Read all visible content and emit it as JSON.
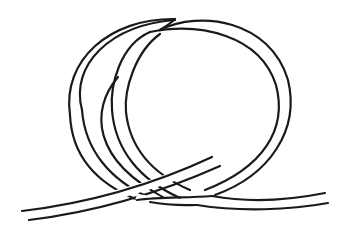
{
  "figure": {
    "colors": {
      "background": "#ffffff",
      "line": "#1a1a1a"
    }
  }
}
